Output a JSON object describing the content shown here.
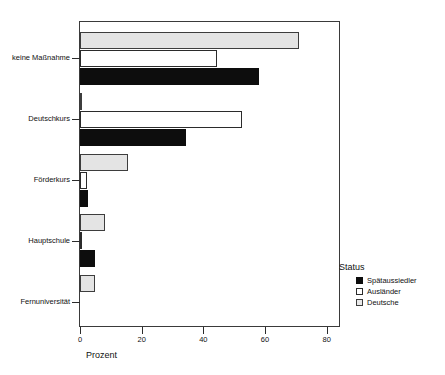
{
  "chart_data": {
    "type": "bar",
    "orientation": "horizontal",
    "title": "",
    "xlabel": "Prozent",
    "ylabel": "",
    "xlim": [
      0,
      84
    ],
    "xticks": [
      0,
      20,
      40,
      60,
      80
    ],
    "xtick_labels": [
      "0",
      "20",
      "40",
      "60",
      "80"
    ],
    "grid": false,
    "categories": [
      "keine Maßnahme",
      "Deutschkurs",
      "Förderkurs",
      "Hauptschule",
      "Fernuniversität"
    ],
    "legend_title": "Status",
    "legend_position": "right",
    "series": [
      {
        "name": "Spätaussiedler",
        "color": "#0d0d0d",
        "values": [
          58.0,
          34.5,
          2.5,
          5.0,
          0.0
        ]
      },
      {
        "name": "Ausländer",
        "color": "#ffffff",
        "values": [
          44.5,
          52.5,
          2.3,
          0.2,
          0.0
        ]
      },
      {
        "name": "Deutsche",
        "color": "#e4e4e4",
        "values": [
          71.0,
          0.4,
          15.5,
          8.0,
          5.0
        ]
      }
    ]
  },
  "axes": {
    "x_title": "Prozent",
    "tick_labels": [
      "0",
      "20",
      "40",
      "60",
      "80"
    ],
    "category_labels": [
      "keine Maßnahme",
      "Deutschkurs",
      "Förderkurs",
      "Hauptschule",
      "Fernuniversität"
    ]
  },
  "legend": {
    "title": "Status",
    "items": [
      {
        "label": "Spätaussiedler",
        "swatch": "sw-spataussiedler"
      },
      {
        "label": "Ausländer",
        "swatch": "sw-auslaender"
      },
      {
        "label": "Deutsche",
        "swatch": "sw-deutsche"
      }
    ]
  }
}
